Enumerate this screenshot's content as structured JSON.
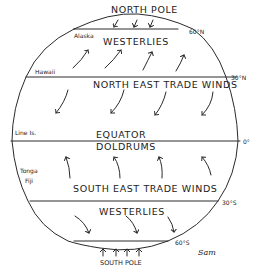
{
  "diagram": {
    "type": "global wind belts",
    "labels": {
      "north_pole": "NORTH POLE",
      "north_westerlies": "WESTERLIES",
      "ne_trades": "NORTH EAST TRADE WINDS",
      "equator": "EQUATOR",
      "doldrums": "DOLDRUMS",
      "se_trades": "SOUTH EAST TRADE WINDS",
      "south_westerlies": "WESTERLIES",
      "south_pole": "SOUTH POLE"
    },
    "latitudes": {
      "lat_60n": "60°N",
      "lat_30n": "30°N",
      "lat_0": "0°",
      "lat_30s": "30°S",
      "lat_60s": "60°S"
    },
    "places": {
      "alaska": "Alaska",
      "hawaii": "Hawaii",
      "line_is": "Line Is.",
      "tonga": "Tonga",
      "fiji": "Fiji"
    },
    "signature": "Sam",
    "arrows": {
      "polar_north": "down (southward) x3",
      "westerlies_north": "up-right (northeast) x4",
      "ne_trades": "down-left (southwest) x4",
      "se_trades": "up (northwest) x4",
      "westerlies_south": "down-right (southeast) x3",
      "polar_south": "up (northward) x4"
    }
  }
}
